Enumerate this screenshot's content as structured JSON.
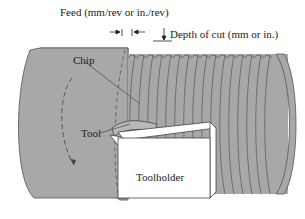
{
  "diagram": {
    "labels": {
      "feed": "Feed (mm/rev or in./rev)",
      "depth": "Depth of cut (mm or in.)",
      "chip": "Chip",
      "tool": "Tool",
      "toolholder": "Toolholder"
    },
    "colors": {
      "workpiece": "#a8a8a8",
      "outline": "#555555",
      "toolholder": "#ffffff",
      "text": "#222222"
    }
  }
}
